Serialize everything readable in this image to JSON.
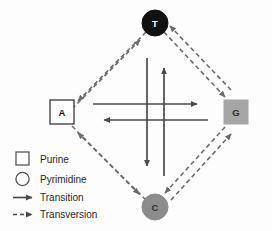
{
  "diagram": {
    "background_color": "#fdfdfd",
    "nodes": [
      {
        "id": "T",
        "label": "T",
        "shape": "circle",
        "base_class": "Pyrimidine",
        "cx": 155,
        "cy": 23,
        "r": 13,
        "fill": "#111111",
        "stroke": "#111111",
        "text_color": "#ffffff"
      },
      {
        "id": "A",
        "label": "A",
        "shape": "square",
        "base_class": "Purine",
        "cx": 62,
        "cy": 112,
        "size": 24,
        "fill": "#ffffff",
        "stroke": "#3a3a3a",
        "text_color": "#1a1a1a"
      },
      {
        "id": "G",
        "label": "G",
        "shape": "square",
        "base_class": "Purine",
        "cx": 236,
        "cy": 112,
        "size": 24,
        "fill": "#a6a6a6",
        "stroke": "#a6a6a6",
        "text_color": "#2b2b2b"
      },
      {
        "id": "C",
        "label": "C",
        "shape": "circle",
        "base_class": "Pyrimidine",
        "cx": 155,
        "cy": 207,
        "r": 13,
        "fill": "#8c8c8c",
        "stroke": "#8c8c8c",
        "text_color": "#333333"
      }
    ],
    "transitions": [
      {
        "id": "a-to-g",
        "from": "A",
        "to": "G",
        "direction": "right",
        "style": "solid"
      },
      {
        "id": "g-to-a",
        "from": "G",
        "to": "A",
        "direction": "left",
        "style": "solid"
      },
      {
        "id": "c-to-t",
        "from": "C",
        "to": "T",
        "direction": "up",
        "style": "solid"
      },
      {
        "id": "t-to-c",
        "from": "T",
        "to": "C",
        "direction": "down",
        "style": "solid"
      }
    ],
    "transversions": [
      {
        "id": "a-to-t",
        "from": "A",
        "to": "T",
        "style": "dashed"
      },
      {
        "id": "t-to-a",
        "from": "T",
        "to": "A",
        "style": "dashed"
      },
      {
        "id": "t-to-g",
        "from": "T",
        "to": "G",
        "style": "dashed"
      },
      {
        "id": "g-to-t",
        "from": "G",
        "to": "T",
        "style": "dashed"
      },
      {
        "id": "a-to-c",
        "from": "A",
        "to": "C",
        "style": "dashed"
      },
      {
        "id": "c-to-a",
        "from": "C",
        "to": "A",
        "style": "dashed"
      },
      {
        "id": "c-to-g",
        "from": "C",
        "to": "G",
        "style": "dashed"
      },
      {
        "id": "g-to-c",
        "from": "G",
        "to": "C",
        "style": "dashed"
      }
    ],
    "arrow_color": "#4a4a4a",
    "dashed_color": "#6b6b6b"
  },
  "legend": {
    "items": [
      {
        "key": "purine",
        "label": "Purine",
        "symbol": "square-outline"
      },
      {
        "key": "pyrimidine",
        "label": "Pyrimidine",
        "symbol": "circle-outline"
      },
      {
        "key": "transition",
        "label": "Transition",
        "symbol": "solid-arrow"
      },
      {
        "key": "transversion",
        "label": "Transversion",
        "symbol": "dashed-arrow"
      }
    ]
  }
}
